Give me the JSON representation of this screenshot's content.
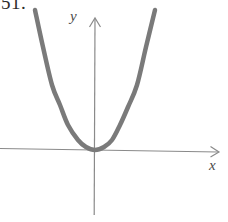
{
  "figure": {
    "exercise_number": "51.",
    "background_color": "#ffffff",
    "width": 228,
    "height": 222
  },
  "axes": {
    "x_axis_label": "x",
    "y_axis_label": "y",
    "axis_color": "#8a8a8a",
    "origin_x": 95,
    "origin_y": 150,
    "x_axis_start_x": 0,
    "x_axis_end_x": 218,
    "x_axis_left_y": 148,
    "x_axis_right_y": 152,
    "y_axis_top_y": 18,
    "y_axis_bottom_y": 215,
    "arrowheads": [
      "x-axis-arrowhead",
      "y-axis-arrowhead"
    ]
  },
  "chart_data": {
    "type": "line",
    "title": "",
    "subtitle": "",
    "xlabel": "x",
    "ylabel": "y",
    "curve_name": "parabola",
    "equation": "y = a x^2",
    "vertex": [
      0,
      0
    ],
    "opens": "up",
    "grid": false,
    "legend": "none",
    "axis_ticks": [],
    "tick_labels": [],
    "annotations": [],
    "stroke_color": "#7a7a7a",
    "stroke_width": 4.5,
    "xlim": [
      -95,
      133
    ],
    "ylim": [
      -65,
      150
    ],
    "pixel_points": [
      [
        35,
        10
      ],
      [
        43,
        47
      ],
      [
        52,
        85
      ],
      [
        60,
        105
      ],
      [
        68,
        125
      ],
      [
        78,
        140
      ],
      [
        86,
        147
      ],
      [
        95,
        150
      ],
      [
        104,
        147
      ],
      [
        112,
        140
      ],
      [
        120,
        125
      ],
      [
        128,
        107
      ],
      [
        137,
        85
      ],
      [
        146,
        47
      ],
      [
        155,
        10
      ]
    ],
    "series": [
      {
        "name": "parabola",
        "x": [
          -60,
          -52,
          -43,
          -35,
          -27,
          -17,
          -9,
          0,
          9,
          17,
          25,
          33,
          42,
          51,
          60
        ],
        "y": [
          140,
          103,
          65,
          45,
          25,
          10,
          3,
          0,
          3,
          10,
          25,
          43,
          65,
          103,
          140
        ]
      }
    ]
  }
}
